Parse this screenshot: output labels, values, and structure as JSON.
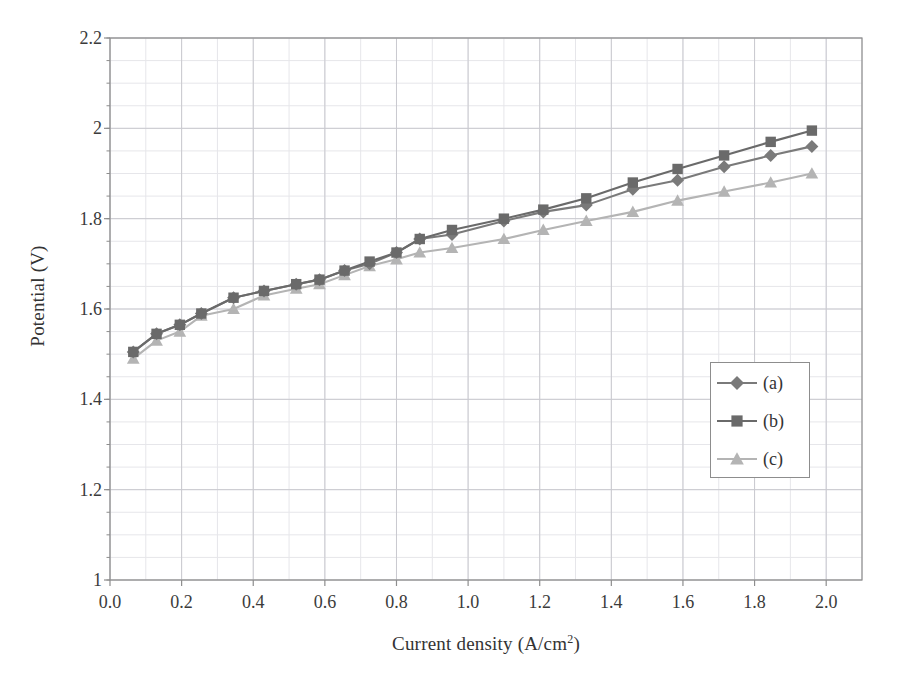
{
  "chart_data": {
    "type": "line",
    "title": "",
    "xlabel": "Current density (A/cm",
    "xlabel_sup": "2",
    "xlabel_suffix": ")",
    "xlabel_full": "Current density (A/cm2)",
    "ylabel": "Potential (V)",
    "xlim": [
      0.0,
      2.1
    ],
    "ylim": [
      1.0,
      2.2
    ],
    "xticks": [
      "0.0",
      "0.2",
      "0.4",
      "0.6",
      "0.8",
      "1.0",
      "1.2",
      "1.4",
      "1.6",
      "1.8",
      "2.0"
    ],
    "xtick_values": [
      0.0,
      0.2,
      0.4,
      0.6,
      0.8,
      1.0,
      1.2,
      1.4,
      1.6,
      1.8,
      2.0
    ],
    "yticks": [
      "1",
      "1.2",
      "1.4",
      "1.6",
      "1.8",
      "2",
      "2.2"
    ],
    "ytick_values": [
      1.0,
      1.2,
      1.4,
      1.6,
      1.8,
      2.0,
      2.2
    ],
    "grid": true,
    "grid_major_x": 0.2,
    "grid_major_y": 0.2,
    "grid_minor_x": 0.1,
    "grid_minor_y": 0.05,
    "legend_position": "center-right",
    "series": [
      {
        "name": "(a)",
        "marker": "diamond",
        "color": "#7a7a7a",
        "x": [
          0.065,
          0.13,
          0.195,
          0.255,
          0.345,
          0.43,
          0.52,
          0.585,
          0.655,
          0.725,
          0.8,
          0.865,
          0.955,
          1.1,
          1.21,
          1.33,
          1.46,
          1.585,
          1.715,
          1.845,
          1.96
        ],
        "y": [
          1.505,
          1.545,
          1.565,
          1.59,
          1.625,
          1.64,
          1.655,
          1.665,
          1.685,
          1.7,
          1.725,
          1.755,
          1.765,
          1.795,
          1.815,
          1.83,
          1.865,
          1.885,
          1.915,
          1.94,
          1.96
        ]
      },
      {
        "name": "(b)",
        "marker": "square",
        "color": "#6a6a6a",
        "x": [
          0.065,
          0.13,
          0.195,
          0.255,
          0.345,
          0.43,
          0.52,
          0.585,
          0.655,
          0.725,
          0.8,
          0.865,
          0.955,
          1.1,
          1.21,
          1.33,
          1.46,
          1.585,
          1.715,
          1.845,
          1.96
        ],
        "y": [
          1.505,
          1.545,
          1.565,
          1.59,
          1.625,
          1.64,
          1.655,
          1.665,
          1.685,
          1.705,
          1.725,
          1.755,
          1.775,
          1.8,
          1.82,
          1.845,
          1.88,
          1.91,
          1.94,
          1.97,
          1.995
        ]
      },
      {
        "name": "(c)",
        "marker": "triangle",
        "color": "#b4b4b4",
        "x": [
          0.065,
          0.13,
          0.195,
          0.255,
          0.345,
          0.43,
          0.52,
          0.585,
          0.655,
          0.725,
          0.8,
          0.865,
          0.955,
          1.1,
          1.21,
          1.33,
          1.46,
          1.585,
          1.715,
          1.845,
          1.96
        ],
        "y": [
          1.49,
          1.53,
          1.55,
          1.585,
          1.6,
          1.63,
          1.645,
          1.655,
          1.675,
          1.695,
          1.71,
          1.725,
          1.735,
          1.755,
          1.775,
          1.795,
          1.815,
          1.84,
          1.86,
          1.88,
          1.9
        ]
      }
    ]
  },
  "legend": {
    "items": [
      {
        "label": "(a)",
        "marker": "diamond",
        "color": "#7a7a7a"
      },
      {
        "label": "(b)",
        "marker": "square",
        "color": "#6a6a6a"
      },
      {
        "label": "(c)",
        "marker": "triangle",
        "color": "#b4b4b4"
      }
    ]
  },
  "colors": {
    "axis": "#8d8d8d",
    "grid_major": "#c9c9cf",
    "grid_minor": "#e6e6ea",
    "text": "#333333",
    "background": "#ffffff"
  }
}
